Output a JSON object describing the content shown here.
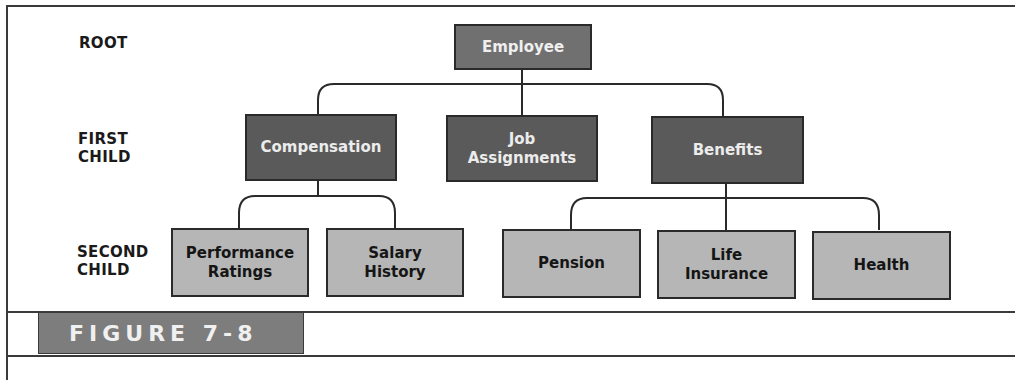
{
  "diagram": {
    "type": "hierarchical-database-tree",
    "levels": {
      "root": "ROOT",
      "first_child_line1": "FIRST",
      "first_child_line2": "CHILD",
      "second_child_line1": "SECOND",
      "second_child_line2": "CHILD"
    },
    "root": {
      "label": "Employee"
    },
    "first_children": [
      {
        "label_line1": "Compensation",
        "label_line2": ""
      },
      {
        "label_line1": "Job",
        "label_line2": "Assignments"
      },
      {
        "label_line1": "Benefits",
        "label_line2": ""
      }
    ],
    "second_children": [
      {
        "parent": "Compensation",
        "label_line1": "Performance",
        "label_line2": "Ratings"
      },
      {
        "parent": "Compensation",
        "label_line1": "Salary",
        "label_line2": "History"
      },
      {
        "parent": "Benefits",
        "label_line1": "Pension",
        "label_line2": ""
      },
      {
        "parent": "Benefits",
        "label_line1": "Life",
        "label_line2": "Insurance"
      },
      {
        "parent": "Benefits",
        "label_line1": "Health",
        "label_line2": ""
      }
    ],
    "colors": {
      "root_fill": "#707070",
      "first_child_fill": "#5a5a5a",
      "second_child_fill": "#b6b6b6",
      "connector": "#2a2a2a"
    }
  },
  "figure": {
    "label": "FIGURE 7-8"
  }
}
